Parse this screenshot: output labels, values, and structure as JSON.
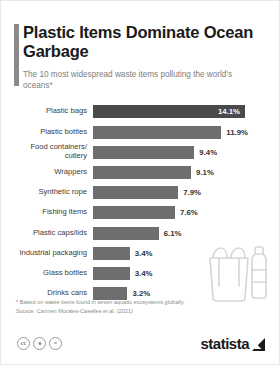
{
  "header": {
    "title": "Plastic Items Dominate Ocean Garbage",
    "subtitle": "The 10 most widespread waste items polluting the world's oceans*"
  },
  "footnotes": {
    "note": "* Based on waste items found in seven aquatic ecosystems globally.",
    "source": "Source: Carmen Morales-Caselles et al. (2021)"
  },
  "footer": {
    "cc_icons": [
      "cc-icon",
      "cc-by-icon",
      "cc-nd-icon"
    ],
    "cc_glyphs": [
      "ⓒ",
      "ⓘ",
      "ⓔ"
    ],
    "brand": "statista",
    "brand_mark": "statista-arrow-icon"
  },
  "colors": {
    "bar": "#6e6e6e",
    "bar_highlight": "#4a4a4a",
    "accent": "#8a8a8a",
    "text": "#3a3a3a",
    "muted": "#8c8c8c"
  },
  "chart_data": {
    "type": "bar",
    "orientation": "horizontal",
    "title": "Plastic Items Dominate Ocean Garbage",
    "subtitle": "The 10 most widespread waste items polluting the world's oceans*",
    "xlabel": "",
    "ylabel": "",
    "xlim": [
      0,
      14.1
    ],
    "grid": false,
    "legend": false,
    "unit": "%",
    "categories": [
      "Plastic bags",
      "Plastic bottles",
      "Food containers/\ncutlery",
      "Wrappers",
      "Synthetic rope",
      "Fishing items",
      "Plastic caps/lids",
      "Industrial packaging",
      "Glass bottles",
      "Drinks cans"
    ],
    "values": [
      14.1,
      11.9,
      9.4,
      9.1,
      7.9,
      7.6,
      6.1,
      3.4,
      3.4,
      3.2
    ],
    "labels": [
      "14.1%",
      "11.9%",
      "9.4%",
      "9.1%",
      "7.9%",
      "7.6%",
      "6.1%",
      "3.4%",
      "3.4%",
      "3.2%"
    ],
    "label_inside": [
      true,
      false,
      false,
      false,
      false,
      false,
      false,
      false,
      false,
      false
    ],
    "highlight_index": 0
  }
}
